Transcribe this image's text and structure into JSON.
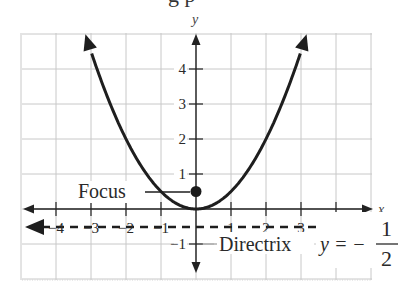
{
  "header": {
    "cropped_title_fragment": "g p"
  },
  "chart_data": {
    "type": "line",
    "title": "",
    "xlabel": "x",
    "ylabel": "y",
    "xlim": [
      -5,
      5
    ],
    "ylim": [
      -2,
      5
    ],
    "grid": true,
    "x_ticks": [
      -4,
      -3,
      -2,
      -1,
      1,
      2,
      3,
      4
    ],
    "y_ticks": [
      -1,
      1,
      2,
      3,
      4
    ],
    "x_tick_labels": [
      "−4",
      "−3",
      "−2",
      "−1",
      "1",
      "2",
      "3",
      "4"
    ],
    "y_tick_labels": [
      "−1",
      "1",
      "2",
      "3",
      "4"
    ],
    "series": [
      {
        "name": "parabola",
        "equation": "y = x^2/2",
        "x": [
          -3.16,
          -3,
          -2.5,
          -2,
          -1.5,
          -1,
          -0.5,
          0,
          0.5,
          1,
          1.5,
          2,
          2.5,
          3,
          3.16
        ],
        "y": [
          5,
          4.5,
          3.125,
          2,
          1.125,
          0.5,
          0.125,
          0,
          0.125,
          0.5,
          1.125,
          2,
          3.125,
          4.5,
          5
        ]
      },
      {
        "name": "directrix",
        "equation": "y = -1/2",
        "x": [
          -5,
          5
        ],
        "y": [
          -0.5,
          -0.5
        ],
        "style": "dashed"
      }
    ],
    "points": [
      {
        "name": "Focus",
        "x": 0,
        "y": 0.5
      }
    ],
    "annotations": {
      "focus_label": "Focus",
      "directrix_label": "Directrix",
      "directrix_eq_lhs": "y = −",
      "directrix_eq_num": "1",
      "directrix_eq_den": "2"
    }
  }
}
